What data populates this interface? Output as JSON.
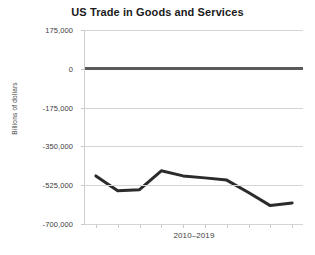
{
  "chart_data": {
    "type": "line",
    "title": "US Trade in Goods and Services",
    "xlabel": "2010–2019",
    "ylabel": "Billions of dollars",
    "x": [
      2010,
      2011,
      2012,
      2013,
      2014,
      2015,
      2016,
      2017,
      2018,
      2019
    ],
    "categories": [
      "2010",
      "2011",
      "2012",
      "2013",
      "2014",
      "2015",
      "2016",
      "2017",
      "2018",
      "2019"
    ],
    "values": [
      -483000,
      -550000,
      -545000,
      -460000,
      -483000,
      -492000,
      -502000,
      -558000,
      -617000,
      -605000
    ],
    "series": [
      {
        "name": "US Trade in Goods and Services",
        "values": [
          -483000,
          -550000,
          -545000,
          -460000,
          -483000,
          -492000,
          -502000,
          -558000,
          -617000,
          -605000
        ],
        "color": "#2b2b2b"
      }
    ],
    "ylim": [
      -700000,
      175000
    ],
    "ytick_values": [
      175000,
      0,
      -175000,
      -350000,
      -525000,
      -700000
    ],
    "ytick_labels": [
      "175,000",
      "0",
      "-175,000",
      "-350,000",
      "-525,000",
      "-700,000"
    ],
    "xtick_labels": [
      "",
      "",
      "",
      "",
      "",
      "",
      "",
      "",
      "",
      ""
    ],
    "grid": true,
    "grid_color": "#d4d4d4",
    "zero_line_color": "#5a5a5a",
    "legend": false,
    "legend_position": "none",
    "line_width": 3,
    "background": "#ffffff",
    "title_color": "#1b1b1b",
    "tick_label_color": "#3d3d3d"
  }
}
